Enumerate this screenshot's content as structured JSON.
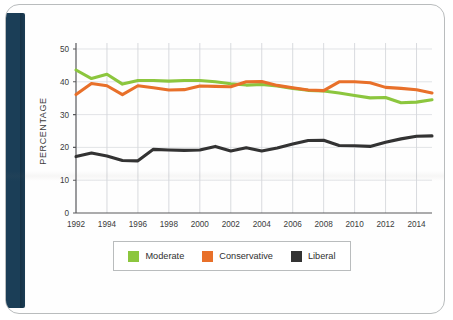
{
  "figure": {
    "frame_color": "#1b3e57",
    "border_color": "#b9bcbd"
  },
  "chart_data": {
    "type": "line",
    "title": "",
    "xlabel": "",
    "ylabel": "PERCENTAGE",
    "ylim": [
      0,
      50
    ],
    "xlim": [
      1992,
      2015
    ],
    "grid": true,
    "legend_position": "bottom",
    "ytick_labels": [
      "0",
      "10",
      "20",
      "30",
      "40",
      "50"
    ],
    "yticks": [
      0,
      10,
      20,
      30,
      40,
      50
    ],
    "xtick_labels": [
      "1992",
      "1994",
      "1996",
      "1998",
      "2000",
      "2002",
      "2004",
      "2006",
      "2008",
      "2010",
      "2012",
      "2014"
    ],
    "xticks": [
      1992,
      1994,
      1996,
      1998,
      2000,
      2002,
      2004,
      2006,
      2008,
      2010,
      2012,
      2014
    ],
    "x": [
      1992,
      1993,
      1994,
      1995,
      1996,
      1997,
      1998,
      1999,
      2000,
      2001,
      2002,
      2003,
      2004,
      2005,
      2006,
      2007,
      2008,
      2009,
      2010,
      2011,
      2012,
      2013,
      2014,
      2015
    ],
    "series": [
      {
        "name": "Moderate",
        "color": "#8cc63e",
        "values": [
          43.6,
          41.0,
          42.3,
          39.3,
          40.4,
          40.4,
          40.2,
          40.4,
          40.4,
          40.0,
          39.4,
          39.0,
          39.2,
          38.7,
          38.0,
          37.4,
          37.2,
          36.6,
          35.8,
          35.1,
          35.2,
          33.6,
          33.8,
          34.5
        ]
      },
      {
        "name": "Conservative",
        "color": "#e8702a",
        "values": [
          36.1,
          39.5,
          38.8,
          36.1,
          38.8,
          38.2,
          37.5,
          37.6,
          38.7,
          38.6,
          38.5,
          40.0,
          40.1,
          38.9,
          38.2,
          37.5,
          37.3,
          40.0,
          40.0,
          39.7,
          38.3,
          38.0,
          37.6,
          36.6
        ]
      },
      {
        "name": "Liberal",
        "color": "#333333",
        "values": [
          17.2,
          18.3,
          17.4,
          16.0,
          15.9,
          19.4,
          19.2,
          19.1,
          19.2,
          20.3,
          18.9,
          19.9,
          18.9,
          19.8,
          21.0,
          22.1,
          22.2,
          20.6,
          20.5,
          20.3,
          21.6,
          22.6,
          23.4,
          23.5
        ]
      }
    ]
  },
  "legend": {
    "entries": [
      {
        "label": "Moderate",
        "color": "#8cc63e"
      },
      {
        "label": "Conservative",
        "color": "#e8702a"
      },
      {
        "label": "Liberal",
        "color": "#333333"
      }
    ]
  }
}
